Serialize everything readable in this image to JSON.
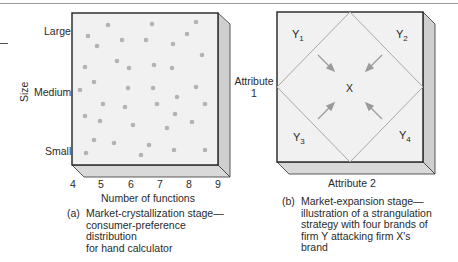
{
  "panel_a": {
    "y_axis_title": "Size",
    "y_ticks": [
      "Large",
      "Medium",
      "Small"
    ],
    "x_ticks": [
      "4",
      "5",
      "6",
      "7",
      "8",
      "9"
    ],
    "x_axis_title": "Number of functions",
    "caption_label": "(a)",
    "caption_lines": [
      "Market-crystallization stage—",
      "consumer-preference distribution",
      "for hand calculator"
    ]
  },
  "panel_b": {
    "corner_labels": [
      {
        "main": "Y",
        "sub": "1"
      },
      {
        "main": "Y",
        "sub": "2"
      },
      {
        "main": "Y",
        "sub": "3"
      },
      {
        "main": "Y",
        "sub": "4"
      }
    ],
    "center_label": "X",
    "y_axis_title_line1": "Attribute",
    "y_axis_title_line2": "1",
    "x_axis_title": "Attribute 2",
    "caption_label": "(b)",
    "caption_lines": [
      "Market-expansion stage—",
      "illustration of a strangulation",
      "strategy with four brands of",
      "firm Y attacking firm X's",
      "brand"
    ]
  },
  "colors": {
    "face": "#f1f1f1",
    "side": "#cfcfcf",
    "bottom": "#d9d9d9",
    "dot": "#b3b3b3",
    "line": "#a8a8a8",
    "border": "#222222"
  }
}
